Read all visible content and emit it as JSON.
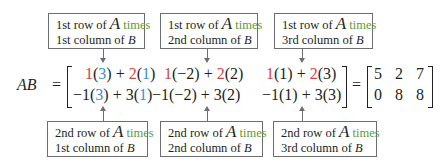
{
  "colors": {
    "red": "#d2434b",
    "blue": "#3b8fd0",
    "green": "#5f9a3c",
    "border": "#6d6e71"
  },
  "labels": {
    "top": [
      {
        "line1_prefix": "1st row of ",
        "var_a": "A",
        "times": "times",
        "line2_prefix": "1st column of ",
        "var_b": "B"
      },
      {
        "line1_prefix": "1st row of ",
        "var_a": "A",
        "times": "times",
        "line2_prefix": "2nd column of ",
        "var_b": "B"
      },
      {
        "line1_prefix": "1st row of ",
        "var_a": "A",
        "times": "times",
        "line2_prefix": "3rd column of ",
        "var_b": "B"
      }
    ],
    "bottom": [
      {
        "line1_prefix": "2nd row of ",
        "var_a": "A",
        "times": "times",
        "line2_prefix": "1st column of ",
        "var_b": "B"
      },
      {
        "line1_prefix": "2nd row of ",
        "var_a": "A",
        "times": "times",
        "line2_prefix": "2nd column of ",
        "var_b": "B"
      },
      {
        "line1_prefix": "2nd row of ",
        "var_a": "A",
        "times": "times",
        "line2_prefix": "3rd column of ",
        "var_b": "B"
      }
    ]
  },
  "equation": {
    "lhs": "AB",
    "equals": "=",
    "row1": [
      {
        "a1": "1",
        "b1": "(3)",
        "plus": " + ",
        "a2": "2",
        "b2": "(1)"
      },
      {
        "a1": "1",
        "b1": "(−2)",
        "plus": " + ",
        "a2": "2",
        "b2": "(2)"
      },
      {
        "a1": "1",
        "b1": "(1)",
        "plus": " + ",
        "a2": "2",
        "b2": "(3)"
      }
    ],
    "row2": [
      {
        "a1": "−1",
        "b1": "(3)",
        "plus": " + ",
        "a2": "3",
        "b2": "(1)"
      },
      {
        "a1": "−1",
        "b1": "(−2)",
        "plus": " + ",
        "a2": "3",
        "b2": "(2)"
      },
      {
        "a1": "−1",
        "b1": "(1)",
        "plus": " + ",
        "a2": "3",
        "b2": "(3)"
      }
    ],
    "result": [
      [
        "5",
        "2",
        "7"
      ],
      [
        "0",
        "8",
        "8"
      ]
    ]
  }
}
